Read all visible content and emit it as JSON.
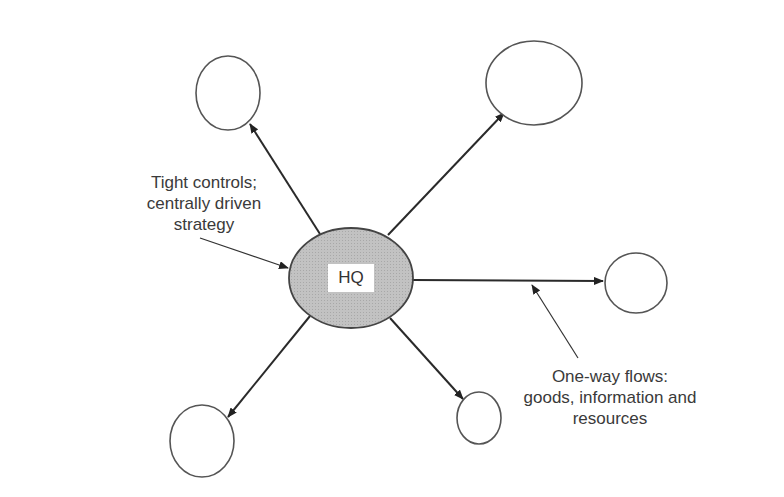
{
  "diagram": {
    "center_node": {
      "label": "HQ",
      "fill": "#bdbdbd"
    },
    "satellite_nodes": [
      {
        "id": "top-left",
        "label": ""
      },
      {
        "id": "top-right",
        "label": ""
      },
      {
        "id": "right",
        "label": ""
      },
      {
        "id": "bottom-left",
        "label": ""
      },
      {
        "id": "bottom-middle",
        "label": ""
      }
    ],
    "annotations": {
      "left": {
        "lines": [
          "Tight controls;",
          "centrally driven",
          "strategy"
        ]
      },
      "right": {
        "lines": [
          "One-way flows:",
          "goods, information and",
          "resources"
        ]
      }
    },
    "colors": {
      "stroke": "#444444",
      "arrow": "#222222",
      "text": "#3a3a3a"
    }
  }
}
